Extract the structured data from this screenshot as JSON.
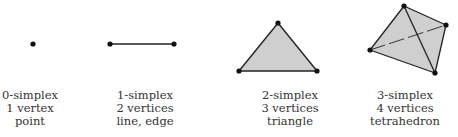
{
  "colors": {
    "stroke": "#222222",
    "vertex": "#111111",
    "fill": "#cfcfcf",
    "text": "#333333"
  },
  "simplices": [
    {
      "name": "0-simplex",
      "vertices_label": "1 vertex",
      "description": "point",
      "label_center_x": 30,
      "points": [
        [
          33,
          44
        ]
      ],
      "edges": [],
      "faces": []
    },
    {
      "name": "1-simplex",
      "vertices_label": "2 vertices",
      "description": "line, edge",
      "label_center_x": 145,
      "points": [
        [
          110,
          44
        ],
        [
          174,
          44
        ]
      ],
      "edges": [
        [
          0,
          1
        ]
      ],
      "faces": []
    },
    {
      "name": "2-simplex",
      "vertices_label": "3 vertices",
      "description": "triangle",
      "label_center_x": 290,
      "points": [
        [
          278,
          23
        ],
        [
          239,
          71
        ],
        [
          317,
          71
        ]
      ],
      "edges": [
        [
          0,
          1
        ],
        [
          1,
          2
        ],
        [
          2,
          0
        ]
      ],
      "faces": [
        [
          0,
          1,
          2
        ]
      ]
    },
    {
      "name": "3-simplex",
      "vertices_label": "4 vertices",
      "description": "tetrahedron",
      "label_center_x": 405,
      "points": [
        [
          404,
          6
        ],
        [
          446,
          25
        ],
        [
          370,
          50
        ],
        [
          435,
          73
        ]
      ],
      "edges": [
        [
          0,
          1
        ],
        [
          1,
          3
        ],
        [
          3,
          2
        ],
        [
          2,
          0
        ],
        [
          0,
          3
        ]
      ],
      "hidden_edges": [
        [
          2,
          1
        ]
      ],
      "faces": [
        [
          0,
          1,
          3,
          2
        ]
      ]
    }
  ]
}
